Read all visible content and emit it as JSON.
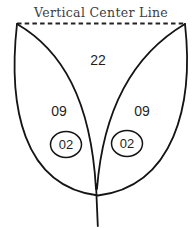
{
  "diagram": {
    "title": "Vertical Center Line",
    "labels": {
      "top_piece": "22",
      "left_mid_piece": "09",
      "right_mid_piece": "09",
      "left_circled_piece": "02",
      "right_circled_piece": "02"
    },
    "colors": {
      "background": "#ffffff",
      "stroke": "#141414",
      "title_text": "#3d3d3d",
      "number_text": "#1f1f1f"
    }
  }
}
